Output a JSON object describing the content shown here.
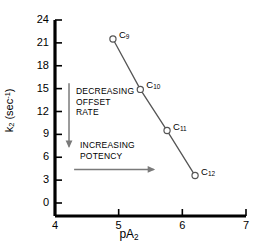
{
  "chart_data": {
    "type": "scatter",
    "title": "",
    "xlabel": "pA2",
    "xlabel_base": "pA",
    "xlabel_sub": "2",
    "ylabel": "k2 (sec-1)",
    "ylabel_base": "k",
    "ylabel_sub": "2",
    "ylabel_unit_open": " (sec",
    "ylabel_unit_sup": "-1",
    "ylabel_unit_close": ")",
    "xlim": [
      4,
      7
    ],
    "ylim": [
      0,
      24
    ],
    "xticks": [
      "4",
      "5",
      "6",
      "7"
    ],
    "xtick_values": [
      4,
      5,
      6,
      7
    ],
    "yticks": [
      "0",
      "3",
      "6",
      "9",
      "12",
      "15",
      "18",
      "21",
      "24"
    ],
    "ytick_values": [
      0,
      3,
      6,
      9,
      12,
      15,
      18,
      21,
      24
    ],
    "grid": false,
    "legend": "none",
    "marker": "open-circle",
    "line_style": "solid",
    "series": [
      {
        "name": "alkyl chain homologs",
        "points": [
          {
            "label": "C9",
            "label_base": "C",
            "label_sub": "9",
            "x": 4.91,
            "y": 21.5
          },
          {
            "label": "C10",
            "label_base": "C",
            "label_sub": "10",
            "x": 5.34,
            "y": 14.9
          },
          {
            "label": "C11",
            "label_base": "C",
            "label_sub": "11",
            "x": 5.76,
            "y": 9.5
          },
          {
            "label": "C12",
            "label_base": "C",
            "label_sub": "12",
            "x": 6.2,
            "y": 3.6
          }
        ]
      }
    ],
    "annotations": [
      {
        "id": "decreasing-offset-rate",
        "text": "DECREASING\nOFFSET\nRATE",
        "arrow": "down",
        "arrow_from_x": 4.22,
        "arrow_from_y": 15.7,
        "arrow_to_x": 4.22,
        "arrow_to_y": 7.4
      },
      {
        "id": "increasing-potency",
        "text": "INCREASING\nPOTENCY",
        "arrow": "right",
        "arrow_from_x": 4.3,
        "arrow_from_y": 4.4,
        "arrow_to_x": 5.55,
        "arrow_to_y": 4.4
      }
    ],
    "colors": {
      "axis": "#000000",
      "line": "#555555",
      "marker_edge": "#555555",
      "marker_face": "#ffffff",
      "arrow": "#7a7a7a",
      "text": "#000000",
      "background": "#ffffff"
    }
  }
}
